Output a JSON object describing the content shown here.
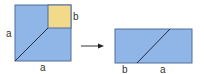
{
  "diagram": {
    "colors": {
      "blue_fill": "#8fb6e6",
      "blue_stroke": "#4f6f9a",
      "yellow_fill": "#f3d98a",
      "line": "#1f2f4a",
      "label": "#333333"
    },
    "left_figure": {
      "description": "Square of side a with small square of side b removed in top-right corner; diagonal cut line",
      "labels": {
        "left_side": "a",
        "bottom_side": "a",
        "small_square_side": "b"
      }
    },
    "arrow": {
      "direction": "right"
    },
    "right_figure": {
      "description": "Rearranged rectangle with diagonal cut",
      "labels": {
        "bottom_left": "b",
        "bottom_right": "a"
      }
    }
  }
}
